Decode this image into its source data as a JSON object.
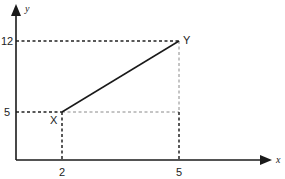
{
  "diagram": {
    "axes": {
      "x_label": "x",
      "y_label": "y"
    },
    "ticks": {
      "x": [
        {
          "label": "2",
          "value": 2
        },
        {
          "label": "5",
          "value": 5
        }
      ],
      "y": [
        {
          "label": "5",
          "value": 5
        },
        {
          "label": "12",
          "value": 12
        }
      ]
    },
    "points": [
      {
        "label": "X",
        "x": 2,
        "y": 5
      },
      {
        "label": "Y",
        "x": 5,
        "y": 12
      }
    ],
    "segment": {
      "from": "X",
      "to": "Y"
    }
  }
}
